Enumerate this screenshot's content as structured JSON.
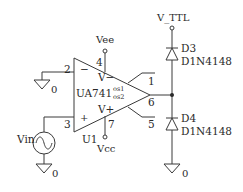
{
  "diagram": {
    "type": "circuit-schematic",
    "opamp": {
      "ref": "U1",
      "part": "UA741",
      "pins": {
        "inv": "2",
        "noninv": "3",
        "vminus": "4",
        "vplus": "7",
        "os1": "1",
        "out": "6",
        "os2": "5"
      },
      "inv_sign": "−",
      "noninv_sign": "+",
      "vminus_label": "V−",
      "vplus_label": "V+",
      "os1_label": "os1",
      "os2_label": "os2"
    },
    "supplies": {
      "vee": "Vee",
      "vcc": "Vcc",
      "vttl": "V_TTL"
    },
    "source": {
      "name": "Vin"
    },
    "grounds": {
      "label": "0"
    },
    "diodes": [
      {
        "ref": "D3",
        "model": "D1N4148"
      },
      {
        "ref": "D4",
        "model": "D1N4148"
      }
    ],
    "colors": {
      "wire": "#3a3a3a",
      "text": "#2a2a2a",
      "background": "#ffffff"
    }
  }
}
